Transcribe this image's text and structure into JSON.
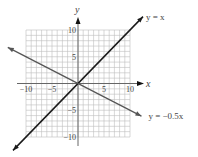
{
  "chart_data": {
    "type": "line",
    "title": "",
    "xlabel": "x",
    "ylabel": "y",
    "xlim": [
      -10,
      10
    ],
    "ylim": [
      -10,
      10
    ],
    "grid": true,
    "grid_step": 1,
    "x_ticks": [
      -10,
      -5,
      5,
      10
    ],
    "y_ticks": [
      10,
      5,
      -5,
      -10
    ],
    "x_tick_labels": [
      "−10",
      "−5",
      "5",
      "10"
    ],
    "y_tick_labels": [
      "10",
      "5",
      "−5",
      "−10"
    ],
    "series": [
      {
        "name": "y = x",
        "label": "y = x",
        "slope": 1,
        "intercept": 0,
        "x": [
          -12.5,
          12.5
        ],
        "y": [
          -12.5,
          12.5
        ],
        "color": "#1a1a1a"
      },
      {
        "name": "y = −0.5x",
        "label": "y = −0.5x",
        "slope": -0.5,
        "intercept": 0,
        "x": [
          -13.5,
          12.2
        ],
        "y": [
          6.75,
          -6.1
        ],
        "color": "#555555"
      }
    ]
  }
}
